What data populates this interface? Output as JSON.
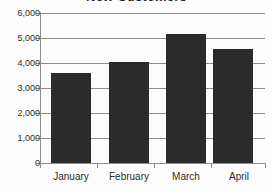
{
  "chart_data": {
    "type": "bar",
    "title": "New Customers",
    "xlabel": "",
    "ylabel": "",
    "categories": [
      "January",
      "February",
      "March",
      "April"
    ],
    "values": [
      3600,
      4050,
      5180,
      4550
    ],
    "series": [
      {
        "name": "New Customers",
        "values": [
          3600,
          4050,
          5180,
          4550
        ]
      }
    ],
    "ylim": [
      0,
      6000
    ],
    "ytick_labels": [
      "0",
      "1,000",
      "2,000",
      "3,000",
      "4,000",
      "5,000",
      "6,000"
    ],
    "ytick_values": [
      0,
      1000,
      2000,
      3000,
      4000,
      5000,
      6000
    ],
    "grid": true,
    "legend": false,
    "legend_position": "none",
    "bar_color": "#2b2b2b",
    "gridline_color": "#8c8c8c",
    "background_color": "#fdfdfd",
    "text_color": "#2b2b2b"
  }
}
